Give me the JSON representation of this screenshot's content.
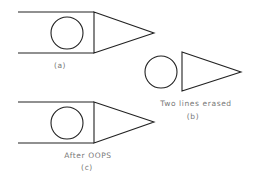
{
  "diagram": {
    "figures": [
      {
        "id": "a",
        "label": "(a)",
        "caption": ""
      },
      {
        "id": "b",
        "label": "(b)",
        "caption": "Two lines erased"
      },
      {
        "id": "c",
        "label": "(c)",
        "caption": "After OOPS"
      }
    ]
  },
  "colors": {
    "stroke": "#222222",
    "text": "#777777",
    "background": "#ffffff"
  }
}
